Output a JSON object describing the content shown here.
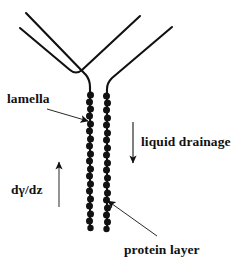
{
  "figure": {
    "kind": "scientific-schematic",
    "title": "",
    "background_color": "#ffffff",
    "stroke_color": "#111111",
    "labels": {
      "lamella": "lamella",
      "liquid_drainage": "liquid drainage",
      "protein_layer": "protein layer",
      "surface_tension_gradient": "dγ/dz"
    },
    "annotations": [
      {
        "name": "lamella",
        "text": "lamella",
        "pointer": "arrow-right",
        "points_to": "lamella-film"
      },
      {
        "name": "liquid-drainage",
        "text": "liquid drainage",
        "pointer": "arrow-down",
        "points_to": "drainage-direction"
      },
      {
        "name": "protein-layer",
        "text": "protein layer",
        "pointer": "arrow-up-left",
        "points_to": "right-protein-chain"
      },
      {
        "name": "surface-tension-gradient",
        "text": "dγ/dz",
        "pointer": "arrow-up",
        "points_to": "marangoni-direction"
      }
    ],
    "elements": {
      "plateau_border": "Y-shaped junction formed by two outer films meeting a vertical lamella",
      "protein_chains": "two vertical beaded chains representing adsorbed protein layers on either film surface",
      "bead_count_per_chain": 18
    }
  }
}
